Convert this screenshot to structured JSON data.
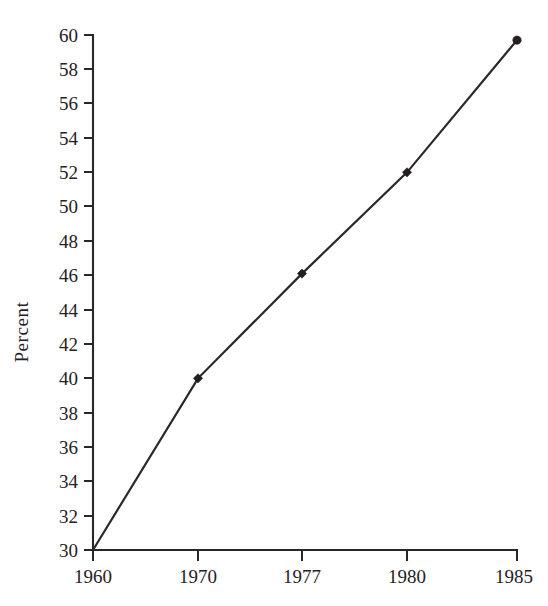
{
  "chart_data": {
    "type": "line",
    "title": "",
    "subtitle": "",
    "xlabel": "",
    "ylabel": "Percent",
    "categories": [
      "1960",
      "1970",
      "1977",
      "1980",
      "1985"
    ],
    "values": [
      30.0,
      40.0,
      46.1,
      52.0,
      59.7
    ],
    "series": [
      {
        "name": "Percent",
        "values": [
          30.0,
          40.0,
          46.1,
          52.0,
          59.7
        ]
      }
    ],
    "x_tick_labels": [
      "1960",
      "1970",
      "1977",
      "1980",
      "1985"
    ],
    "y_tick_labels": [
      "30",
      "32",
      "34",
      "36",
      "38",
      "40",
      "42",
      "44",
      "46",
      "48",
      "50",
      "52",
      "54",
      "56",
      "58",
      "60"
    ],
    "y_tick_values": [
      30,
      32,
      34,
      36,
      38,
      40,
      42,
      44,
      46,
      48,
      50,
      52,
      54,
      56,
      58,
      60
    ],
    "ylim": [
      30,
      60
    ],
    "y_tick_step": 2,
    "x_axis_scale": "categorical",
    "grid": false,
    "legend": false,
    "legend_position": "none",
    "annotations": [],
    "marker_style": "diamond",
    "line_color": "#2b2827",
    "marker_color": "#241f1e",
    "axis_color": "#2a2726",
    "background_color": "#ffffff",
    "tick_direction": "out"
  },
  "figure": {
    "name": "percent-line-chart"
  }
}
